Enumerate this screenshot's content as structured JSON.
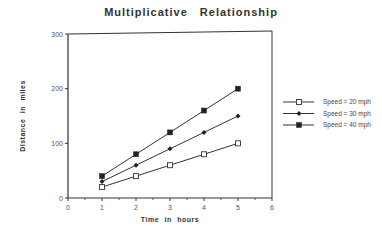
{
  "chart_data": {
    "type": "line",
    "title": "Multiplicative Relationship",
    "xlabel": "Time in hours",
    "ylabel": "Distance in miles",
    "xlim": [
      0,
      6
    ],
    "ylim": [
      0,
      300
    ],
    "x_ticks": [
      "0",
      "1",
      "2",
      "3",
      "4",
      "5",
      "6"
    ],
    "y_ticks": [
      "0",
      "100",
      "200",
      "300"
    ],
    "grid": false,
    "legend_position": "right",
    "x": [
      1,
      2,
      3,
      4,
      5
    ],
    "series": [
      {
        "name": "Speed = 20 mph",
        "marker": "open-square",
        "values": [
          20,
          40,
          60,
          80,
          100
        ]
      },
      {
        "name": "Speed = 30 mph",
        "marker": "filled-diamond",
        "values": [
          30,
          60,
          90,
          120,
          150
        ]
      },
      {
        "name": "Speed = 40 mph",
        "marker": "filled-square",
        "values": [
          40,
          80,
          120,
          160,
          200
        ]
      }
    ]
  }
}
